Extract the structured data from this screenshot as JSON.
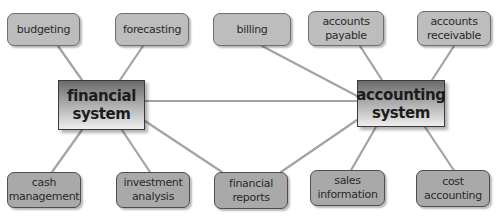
{
  "diagram": {
    "type": "concept-map",
    "colors": {
      "link": "#a0a0a0",
      "node_fill_top": "#bdbdbd",
      "node_fill_bottom": "#a9a9a9",
      "node_border": "#6e6e6e",
      "hub_gradient_top": "#6a6a6a",
      "hub_gradient_bottom": "#eeeeee"
    },
    "hubs": [
      {
        "id": "financial",
        "label": "financial\nsystem"
      },
      {
        "id": "accounting",
        "label": "accounting\nsystem"
      }
    ],
    "top_nodes": [
      {
        "id": "budgeting",
        "label": "budgeting",
        "connects_to": "financial"
      },
      {
        "id": "forecasting",
        "label": "forecasting",
        "connects_to": "financial"
      },
      {
        "id": "billing",
        "label": "billing",
        "connects_to": "accounting"
      },
      {
        "id": "accounts_payable",
        "label": "accounts\npayable",
        "connects_to": "accounting"
      },
      {
        "id": "accounts_receivable",
        "label": "accounts\nreceivable",
        "connects_to": "accounting"
      }
    ],
    "bottom_nodes": [
      {
        "id": "cash_management",
        "label": "cash\nmanagement",
        "connects_to": "financial"
      },
      {
        "id": "investment_analysis",
        "label": "investment\nanalysis",
        "connects_to": "financial"
      },
      {
        "id": "financial_reports",
        "label": "financial\nreports",
        "connects_to": [
          "financial",
          "accounting"
        ]
      },
      {
        "id": "sales_information",
        "label": "sales\ninformation",
        "connects_to": "accounting"
      },
      {
        "id": "cost_accounting",
        "label": "cost\naccounting",
        "connects_to": "accounting"
      }
    ],
    "edges": [
      [
        "financial",
        "accounting"
      ],
      [
        "budgeting",
        "financial"
      ],
      [
        "forecasting",
        "financial"
      ],
      [
        "cash_management",
        "financial"
      ],
      [
        "investment_analysis",
        "financial"
      ],
      [
        "financial_reports",
        "financial"
      ],
      [
        "financial_reports",
        "accounting"
      ],
      [
        "billing",
        "accounting"
      ],
      [
        "accounts_payable",
        "accounting"
      ],
      [
        "accounts_receivable",
        "accounting"
      ],
      [
        "sales_information",
        "accounting"
      ],
      [
        "cost_accounting",
        "accounting"
      ]
    ]
  }
}
